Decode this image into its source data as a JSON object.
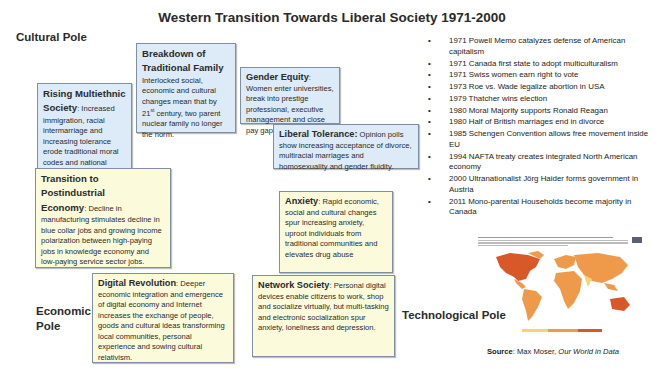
{
  "title": "Western Transition Towards Liberal Society 1971-2000",
  "poles": {
    "cultural": "Cultural Pole",
    "economic_line1": "Economic",
    "economic_line2": "Pole",
    "technological": "Technological Pole"
  },
  "boxes": {
    "multiethnic": {
      "heading_line1": "Rising Multiethnic",
      "heading_line2": "Society",
      "body": ": Increased immigration, racial intermarriage and increasing tolerance erode traditional moral codes and national ideas."
    },
    "family": {
      "heading_line1": "Breakdown of",
      "heading_line2": "Traditional Family",
      "body_pre": "Interlocked social, economic and cultural changes mean that by 21",
      "body_sup": "st",
      "body_post": " century, two parent nuclear family no longer the norm."
    },
    "gender": {
      "heading": "Gender Equity",
      "body": ": Women enter universities, break into prestige professional, executive management and close pay gap."
    },
    "tolerance": {
      "heading": "Liberal Tolerance:",
      "body": " Opinion polls show increasing acceptance of divorce, multiracial marriages and homosexuality and gender fluidity."
    },
    "postindustrial": {
      "heading_line1": "Transition to Postindustrial",
      "heading_line2": "Economy",
      "body": ": Decline in manufacturing stimulates decline in blue collar jobs and growing income polarization between high-paying jobs in knowledge economy and low-paying service sector jobs."
    },
    "anxiety": {
      "heading": "Anxiety",
      "body": ": Rapid economic, social and cultural changes spur increasing anxiety, uproot individuals from traditional communities and elevates drug abuse"
    },
    "digital": {
      "heading": "Digital Revolution",
      "body": ": Deeper economic integration and emergence of digital economy and Internet increases the exchange of people, goods and cultural ideas transforming local communities, personal experience and sowing cultural relativism."
    },
    "network": {
      "heading": "Network Society",
      "body": ": Personal digital devices enable citizens to work, shop and socialize virtually, but multi-tasking and electronic socialization spur anxiety, loneliness and depression."
    }
  },
  "events": [
    "1971 Powell Memo catalyzes defense of American capitalism",
    "1971 Canada first state to adopt multiculturalism",
    "1971 Swiss women earn right to vote",
    "1973 Roe vs. Wade legalize abortion in USA",
    "1979 Thatcher wins election",
    "1980 Moral Majority supports Ronald Reagan",
    "1980 Half of British marriages end in divorce",
    "1985 Schengen Convention allows free movement inside EU",
    "1994 NAFTA treaty creates integrated North American economy",
    "2000 Ultranationalist Jörg Haider forms government in Austria",
    "2011 Mono-parental Households become majority in Canada"
  ],
  "map": {
    "caption": "Share of population with mental health and substance use disorders, 2000",
    "colors": {
      "low": "#f6d27a",
      "mid": "#ef9a4a",
      "high": "#d9582a",
      "ocean": "#ffffff"
    }
  },
  "source": {
    "label": "Source",
    "text": ": Max Moser, ",
    "publication": "Our World in Data"
  }
}
